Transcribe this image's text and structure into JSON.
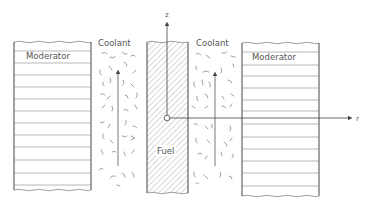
{
  "diagram": {
    "labels": {
      "moderator_left": "Moderator",
      "moderator_right": "Moderator",
      "coolant_left": "Coolant",
      "coolant_right": "Coolant",
      "fuel": "Fuel",
      "z_axis": "z",
      "r_axis": "r"
    },
    "regions": [
      {
        "name": "moderator-left",
        "type": "moderator",
        "x": [
          14,
          91
        ],
        "y": [
          42,
          190
        ]
      },
      {
        "name": "coolant-left",
        "type": "coolant",
        "x": [
          95,
          145
        ],
        "y": [
          50,
          195
        ]
      },
      {
        "name": "fuel",
        "type": "fuel",
        "x": [
          147,
          188
        ],
        "y": [
          42,
          193
        ]
      },
      {
        "name": "coolant-right",
        "type": "coolant",
        "x": [
          190,
          240
        ],
        "y": [
          50,
          195
        ]
      },
      {
        "name": "moderator-right",
        "type": "moderator",
        "x": [
          242,
          319
        ],
        "y": [
          43,
          197
        ]
      }
    ],
    "axes": {
      "origin": [
        167,
        118
      ],
      "z": {
        "from": [
          167,
          118
        ],
        "to": [
          167,
          20
        ]
      },
      "r": {
        "from": [
          167,
          118
        ],
        "to": [
          354,
          118
        ]
      }
    },
    "flow_arrows": [
      {
        "name": "coolant-left-flow",
        "x": 118,
        "from_y": 166,
        "to_y": 68
      },
      {
        "name": "coolant-right-flow",
        "x": 215,
        "from_y": 166,
        "to_y": 70
      }
    ],
    "colors": {
      "line": "#555555",
      "hatch": "#888888",
      "background": "#ffffff"
    }
  }
}
